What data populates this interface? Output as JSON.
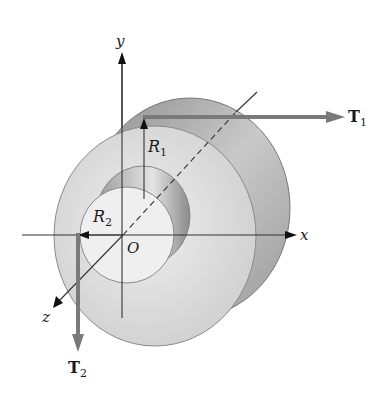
{
  "diagram": {
    "axes": {
      "x": "x",
      "y": "y",
      "z": "z",
      "origin": "O"
    },
    "radii": {
      "outer": {
        "symbol": "R",
        "subscript": "1"
      },
      "inner": {
        "symbol": "R",
        "subscript": "2"
      }
    },
    "forces": [
      {
        "symbol": "T",
        "subscript": "1",
        "direction": "+x",
        "applied_at": "top of outer radius"
      },
      {
        "symbol": "T",
        "subscript": "2",
        "direction": "-y",
        "applied_at": "left of inner radius"
      }
    ],
    "colors": {
      "force_arrow": "#7a7a7a",
      "outer_face": "#d9d9d9",
      "inner_face": "#ececec",
      "shadow": "#8c8c8c",
      "axis": "#222222"
    }
  }
}
